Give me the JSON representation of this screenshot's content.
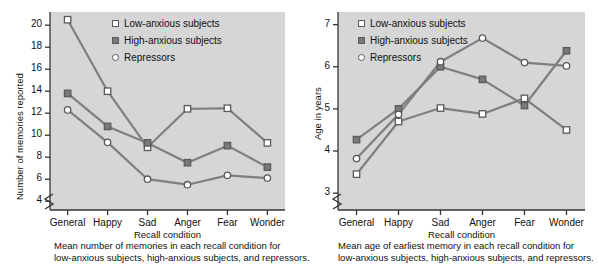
{
  "figure": {
    "panels": [
      {
        "id": "left",
        "legend": [
          {
            "label": "Low-anxious subjects",
            "marker": "open-square"
          },
          {
            "label": "High-anxious subjects",
            "marker": "filled-square"
          },
          {
            "label": "Repressors",
            "marker": "open-circle"
          }
        ],
        "caption_line1": "Mean number of memories in each recall condition for",
        "caption_line2": "low-anxious subjects, high-anxious subjects, and repressors.",
        "chart_data": {
          "type": "line",
          "title": "",
          "xlabel": "Recall condition",
          "ylabel": "Number of memories reported",
          "categories": [
            "General",
            "Happy",
            "Sad",
            "Anger",
            "Fear",
            "Wonder"
          ],
          "yticks": [
            4,
            6,
            8,
            10,
            12,
            14,
            16,
            18,
            20
          ],
          "ylim": [
            3.2,
            21.2
          ],
          "axis_break": true,
          "grid": false,
          "legend_position": "top-right-inside",
          "series": [
            {
              "name": "Low-anxious subjects",
              "marker": "open-square",
              "values": [
                20.5,
                14.0,
                8.9,
                12.4,
                12.45,
                9.3
              ]
            },
            {
              "name": "High-anxious subjects",
              "marker": "filled-square",
              "values": [
                13.8,
                10.8,
                9.3,
                7.5,
                9.05,
                7.1
              ]
            },
            {
              "name": "Repressors",
              "marker": "open-circle",
              "values": [
                12.3,
                9.35,
                6.0,
                5.5,
                6.35,
                6.1
              ]
            }
          ]
        }
      },
      {
        "id": "right",
        "legend": [
          {
            "label": "Low-anxious subjects",
            "marker": "open-square"
          },
          {
            "label": "High-anxious subjects",
            "marker": "filled-square"
          },
          {
            "label": "Repressors",
            "marker": "open-circle"
          }
        ],
        "caption_line1": "Mean age of earliest memory in each recall condition for",
        "caption_line2": "low-anxious subjects, high-anxious subjects, and repressors.",
        "chart_data": {
          "type": "line",
          "title": "",
          "xlabel": "Recall condition",
          "ylabel": "Age in years",
          "categories": [
            "General",
            "Happy",
            "Sad",
            "Anger",
            "Fear",
            "Wonder"
          ],
          "yticks": [
            3,
            4,
            5,
            6,
            7
          ],
          "ylim": [
            2.6,
            7.3
          ],
          "axis_break": true,
          "grid": false,
          "legend_position": "top-left-inside",
          "series": [
            {
              "name": "Low-anxious subjects",
              "marker": "open-square",
              "values": [
                3.45,
                4.7,
                5.02,
                4.88,
                5.25,
                4.5
              ]
            },
            {
              "name": "High-anxious subjects",
              "marker": "filled-square",
              "values": [
                4.27,
                5.0,
                6.0,
                5.7,
                5.08,
                6.38
              ]
            },
            {
              "name": "Repressors",
              "marker": "open-circle",
              "values": [
                3.82,
                4.87,
                6.12,
                6.68,
                6.1,
                6.02
              ]
            }
          ]
        }
      }
    ],
    "colors": {
      "plot_background": "#d6d6d6",
      "page_background": "#ffffff",
      "line": "#7f7f7f",
      "axis": "#333333",
      "marker_open_fill": "#ffffff",
      "marker_filled_fill": "#7a7a7a",
      "marker_stroke": "#5a5a5a",
      "text": "#111111"
    }
  }
}
